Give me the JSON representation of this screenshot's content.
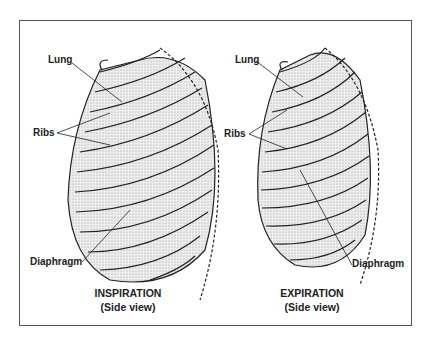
{
  "figure": {
    "panels": [
      {
        "id": "inspiration",
        "caption_title": "INSPIRATION",
        "caption_sub": "(Side view)",
        "labels": {
          "lung": "Lung",
          "ribs": "Ribs",
          "diaphragm": "Diaphragm"
        }
      },
      {
        "id": "expiration",
        "caption_title": "EXPIRATION",
        "caption_sub": "(Side view)",
        "labels": {
          "lung": "Lung",
          "ribs": "Ribs",
          "diaphragm": "Diaphragm"
        }
      }
    ]
  }
}
